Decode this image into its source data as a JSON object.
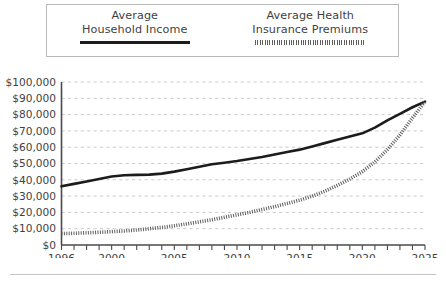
{
  "chart_data": {
    "type": "line",
    "title": "",
    "subtitle": "",
    "xlabel": "",
    "ylabel": "",
    "xlim": [
      1996,
      2025
    ],
    "ylim": [
      0,
      100000
    ],
    "grid": "horizontal-dashed",
    "legend_position": "top",
    "y_tick_labels": [
      "$100,000",
      "$90,000",
      "$80,000",
      "$70,000",
      "$60,000",
      "$50,000",
      "$40,000",
      "$30,000",
      "$20,000",
      "$10,000",
      "$0"
    ],
    "y_tick_values": [
      100000,
      90000,
      80000,
      70000,
      60000,
      50000,
      40000,
      30000,
      20000,
      10000,
      0
    ],
    "x_tick_labels": [
      "1996",
      "2000",
      "2005",
      "2010",
      "2015",
      "2020",
      "2025"
    ],
    "x_tick_values": [
      1996,
      2000,
      2005,
      2010,
      2015,
      2020,
      2025
    ],
    "x_minor_ticks": [
      1996,
      1997,
      1998,
      1999,
      2000,
      2001,
      2002,
      2003,
      2004,
      2005,
      2006,
      2007,
      2008,
      2009,
      2010,
      2011,
      2012,
      2013,
      2014,
      2015,
      2016,
      2017,
      2018,
      2019,
      2020,
      2021,
      2022,
      2023,
      2024,
      2025
    ],
    "x": [
      1996,
      1997,
      1998,
      1999,
      2000,
      2001,
      2002,
      2003,
      2004,
      2005,
      2006,
      2007,
      2008,
      2009,
      2010,
      2011,
      2012,
      2013,
      2014,
      2015,
      2016,
      2017,
      2018,
      2019,
      2020,
      2021,
      2022,
      2023,
      2024,
      2025
    ],
    "series": [
      {
        "name": "Average Household Income",
        "style": "solid",
        "color": "#1c1c1c",
        "values": [
          36000,
          37500,
          39000,
          40500,
          42000,
          42800,
          43000,
          43200,
          43800,
          45000,
          46500,
          48000,
          49500,
          50500,
          51500,
          52800,
          54000,
          55500,
          57000,
          58500,
          60500,
          62500,
          64500,
          66500,
          68500,
          72000,
          76500,
          80500,
          84500,
          88000
        ]
      },
      {
        "name": "Average Health Insurance Premiums",
        "style": "dotted",
        "color": "#5e5e5e",
        "values": [
          7000,
          7200,
          7500,
          7800,
          8200,
          8600,
          9200,
          10000,
          10800,
          11800,
          13000,
          14200,
          15500,
          17000,
          18500,
          20000,
          21800,
          23500,
          25500,
          27500,
          30000,
          33000,
          36500,
          40500,
          45000,
          51000,
          58500,
          67500,
          78000,
          88000
        ]
      }
    ]
  },
  "legend": {
    "entries": [
      {
        "line1": "Average",
        "line2": "Household Income",
        "swatch": "solid-line-swatch"
      },
      {
        "line1": "Average Health",
        "line2": "Insurance Premiums",
        "swatch": "dotted-line-swatch"
      }
    ]
  }
}
